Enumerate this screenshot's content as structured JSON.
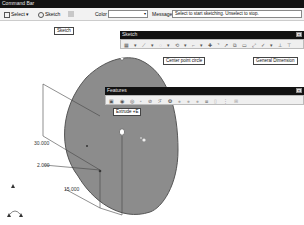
{
  "command_bar": {
    "title": "Command Bar",
    "select_label": "Select",
    "sketch_label": "Sketch",
    "color_label": "Color",
    "color_value": "",
    "message_label": "Message",
    "message_value": "Select to start sketching. Unselect to stop."
  },
  "tooltips": {
    "sketch": "Sketch",
    "center_point_circle": "Center point circle",
    "general_dimension": "General Dimension",
    "extrude": "Extrude"
  },
  "extrude_shortcut": "+E",
  "sketch_toolbar": {
    "title": "Sketch",
    "close": "×",
    "icons": [
      "grid-icon",
      "line-icon",
      "center-point-circle-icon",
      "arc-icon",
      "polyline-icon",
      "point-icon",
      "trim-icon",
      "extend-icon",
      "offset-icon",
      "rectangle-icon",
      "general-dimension-icon",
      "constraint-icon",
      "mirror-icon",
      "pattern-icon"
    ]
  },
  "features_toolbar": {
    "title": "Features",
    "close": "×",
    "icons": [
      "extrude-icon",
      "revolve-icon",
      "sweep-icon",
      "loft-icon",
      "hole-icon",
      "fillet-icon",
      "chamfer-icon",
      "shell-icon",
      "rib-icon",
      "draft-icon",
      "pattern-icon",
      "mirror-icon",
      "boolean-icon",
      "split-icon"
    ]
  },
  "dimensions": {
    "d1": "30.000",
    "d2": "2.000",
    "d3": "15.000"
  },
  "colors": {
    "titlebar": "#121212",
    "toolbar": "#efefef",
    "disc": "#8c8c8c",
    "disc_edge": "#5a5a5a"
  }
}
